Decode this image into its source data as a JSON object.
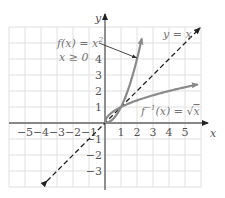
{
  "chart_data": {
    "type": "line",
    "title": "",
    "xlabel": "x",
    "ylabel": "y",
    "xlim": [
      -6,
      6
    ],
    "ylim": [
      -4,
      6
    ],
    "grid": true,
    "x_ticks": [
      "-5",
      "-4",
      "-3",
      "-2",
      "-1",
      "1",
      "2",
      "3",
      "4",
      "5"
    ],
    "y_ticks": [
      "4",
      "3",
      "2",
      "1",
      "-1",
      "-2",
      "-3"
    ],
    "series": [
      {
        "name": "f(x) = x², x ≥ 0",
        "style": "solid",
        "color": "#888888",
        "x": [
          0,
          0.5,
          1,
          1.5,
          2,
          2.3
        ],
        "y": [
          0,
          0.25,
          1,
          2.25,
          4,
          5.3
        ]
      },
      {
        "name": "f⁻¹(x) = √x",
        "style": "solid",
        "color": "#888888",
        "x": [
          0,
          0.25,
          1,
          2.25,
          4,
          5.8
        ],
        "y": [
          0,
          0.5,
          1,
          1.5,
          2,
          2.4
        ]
      },
      {
        "name": "y = x",
        "style": "dashed",
        "color": "#222222",
        "x": [
          -3.6,
          6
        ],
        "y": [
          -3.6,
          6
        ]
      }
    ],
    "annotations": [
      {
        "text": "f(x) = x²",
        "sub": "x ≥ 0",
        "arrow_to": [
          2.1,
          4.5
        ]
      },
      {
        "text": "y = x"
      },
      {
        "text": "f⁻¹(x) = √x"
      }
    ]
  },
  "labels": {
    "x_axis": "x",
    "y_axis": "y",
    "f_label": "f(x) = x",
    "f_sup": "2",
    "f_cond": "x ≥ 0",
    "identity": "y = x",
    "inv_label": "f",
    "inv_sup": "−1",
    "inv_rest": "(x) = ",
    "inv_sqrt": "x"
  },
  "ticks": {
    "x": [
      {
        "t": "−5",
        "v": -5
      },
      {
        "t": "−4",
        "v": -4
      },
      {
        "t": "−3",
        "v": -3
      },
      {
        "t": "−2",
        "v": -2
      },
      {
        "t": "−1",
        "v": -1
      },
      {
        "t": "1",
        "v": 1
      },
      {
        "t": "2",
        "v": 2
      },
      {
        "t": "3",
        "v": 3
      },
      {
        "t": "4",
        "v": 4
      },
      {
        "t": "5",
        "v": 5
      }
    ],
    "y": [
      {
        "t": "4",
        "v": 4
      },
      {
        "t": "3",
        "v": 3
      },
      {
        "t": "2",
        "v": 2
      },
      {
        "t": "1",
        "v": 1
      },
      {
        "t": "−1",
        "v": -1
      },
      {
        "t": "−2",
        "v": -2
      },
      {
        "t": "−3",
        "v": -3
      }
    ]
  },
  "colors": {
    "grid": "#dddddd",
    "axis": "#666666",
    "curve": "#8a8a8a",
    "dashed": "#222222"
  }
}
